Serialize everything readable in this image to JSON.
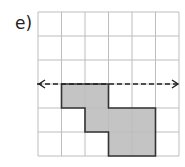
{
  "label": "e)",
  "grid": {
    "cols": 6,
    "rows": 6,
    "x0": 38,
    "y0": 12,
    "cell_w": 23.5,
    "cell_h": 24
  },
  "shape_cells": [
    [
      1,
      3
    ],
    [
      2,
      3
    ],
    [
      2,
      4
    ],
    [
      3,
      4
    ],
    [
      4,
      4
    ],
    [
      3,
      5
    ],
    [
      4,
      5
    ]
  ],
  "mirror_line": {
    "row_boundary": 3,
    "style": "dashed",
    "arrows": "both"
  },
  "colors": {
    "grid": "#bdbdbd",
    "fill": "#c4c4c4",
    "outline": "#333333",
    "line": "#222222"
  }
}
